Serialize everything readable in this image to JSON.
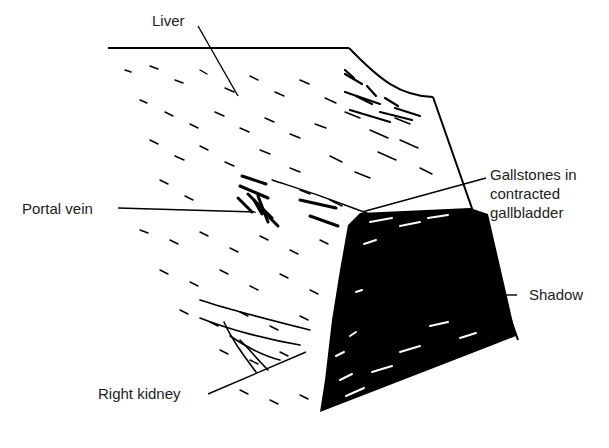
{
  "figure": {
    "type": "ultrasound-scan-illustration",
    "labels": {
      "liver": "Liver",
      "portal_vein": "Portal vein",
      "gallstones_line1": "Gallstones in",
      "gallstones_line2": "contracted",
      "gallstones_line3": "gallbladder",
      "shadow": "Shadow",
      "right_kidney": "Right kidney"
    },
    "colors": {
      "background": "#ffffff",
      "ink": "#000000",
      "text": "#222222"
    }
  }
}
